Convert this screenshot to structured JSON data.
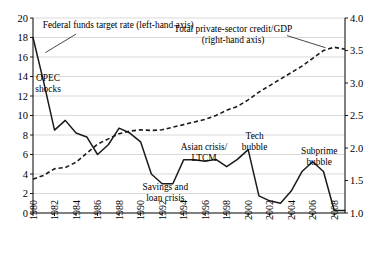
{
  "chart_data": {
    "type": "line",
    "title": "",
    "xlabel": "",
    "ylabel": "",
    "grid": true,
    "legend_position": "inline-annotations",
    "x": [
      1980,
      1981,
      1982,
      1983,
      1984,
      1985,
      1986,
      1987,
      1988,
      1989,
      1990,
      1991,
      1992,
      1993,
      1994,
      1995,
      1996,
      1997,
      1998,
      1999,
      2000,
      2001,
      2002,
      2003,
      2004,
      2005,
      2006,
      2007,
      2008,
      2009
    ],
    "xtick_labels": [
      "1980",
      "1982",
      "1984",
      "1986",
      "1988",
      "1990",
      "1992",
      "1994",
      "1996",
      "1998",
      "2000",
      "2002",
      "2004",
      "2006",
      "2008"
    ],
    "xtick_values": [
      1980,
      1982,
      1984,
      1986,
      1988,
      1990,
      1992,
      1994,
      1996,
      1998,
      2000,
      2002,
      2004,
      2006,
      2008
    ],
    "xlim": [
      1980,
      2009
    ],
    "left_axis": {
      "label": "Federal funds target rate (left-hand axis)",
      "ylim": [
        0,
        20
      ],
      "ticks": [
        0,
        2,
        4,
        6,
        8,
        10,
        12,
        14,
        16,
        18,
        20
      ],
      "tick_labels": [
        "0",
        "2",
        "4",
        "6",
        "8",
        "10",
        "12",
        "14",
        "16",
        "18",
        "20"
      ]
    },
    "right_axis": {
      "label": "Total private-sector credit/GDP (right-hand axis)",
      "ylim": [
        1.0,
        4.0
      ],
      "ticks": [
        1.0,
        1.5,
        2.0,
        2.5,
        3.0,
        3.5,
        4.0
      ],
      "tick_labels": [
        "1.0",
        "1.5",
        "2.0",
        "2.5",
        "3.0",
        "3.5",
        "4.0"
      ]
    },
    "series": [
      {
        "name": "Federal funds target rate",
        "axis": "left",
        "style": "solid",
        "color": "#1a1a1a",
        "values": [
          18.0,
          13.4,
          8.5,
          9.5,
          8.2,
          7.8,
          6.0,
          7.0,
          8.7,
          8.2,
          7.3,
          4.0,
          3.0,
          3.0,
          5.45,
          5.45,
          5.3,
          5.5,
          4.75,
          5.5,
          6.5,
          1.75,
          1.25,
          1.0,
          2.25,
          4.25,
          5.25,
          4.25,
          0.25,
          0.25
        ]
      },
      {
        "name": "Total private-sector credit/GDP",
        "axis": "right",
        "style": "dashed",
        "color": "#1a1a1a",
        "values": [
          1.52,
          1.58,
          1.68,
          1.7,
          1.78,
          1.92,
          2.06,
          2.14,
          2.22,
          2.26,
          2.28,
          2.27,
          2.28,
          2.32,
          2.36,
          2.4,
          2.44,
          2.5,
          2.58,
          2.64,
          2.74,
          2.86,
          2.96,
          3.06,
          3.16,
          3.26,
          3.38,
          3.5,
          3.55,
          3.52
        ]
      }
    ],
    "annotations": [
      {
        "name": "federal-funds-label",
        "text": "Federal funds target rate (left-hand axis)",
        "x": 1980.9,
        "y_left": 19.0
      },
      {
        "name": "opec-shocks-label",
        "line1": "OPEC",
        "line2": "shocks",
        "x": 1981.4,
        "y_left": 13.5
      },
      {
        "name": "credit-gdp-label",
        "line1": "Total private-sector credit/GDP",
        "line2": "(right-hand axis)",
        "x": 1998.6,
        "y_left": 18.6
      },
      {
        "name": "savings-loan-label",
        "line1": "Savings and",
        "line2": "loan crisis",
        "x": 1992.3,
        "y_left": 2.4
      },
      {
        "name": "asian-crisis-label",
        "line1": "Asian crisis/",
        "line2": "LTCM",
        "x": 1995.9,
        "y_left": 6.5
      },
      {
        "name": "tech-bubble-label",
        "line1": "Tech",
        "line2": "bubble",
        "x": 2000.6,
        "y_left": 7.6
      },
      {
        "name": "subprime-bubble-label",
        "line1": "Subprime",
        "line2": "bubble",
        "x": 2006.6,
        "y_left": 6.1
      }
    ]
  }
}
